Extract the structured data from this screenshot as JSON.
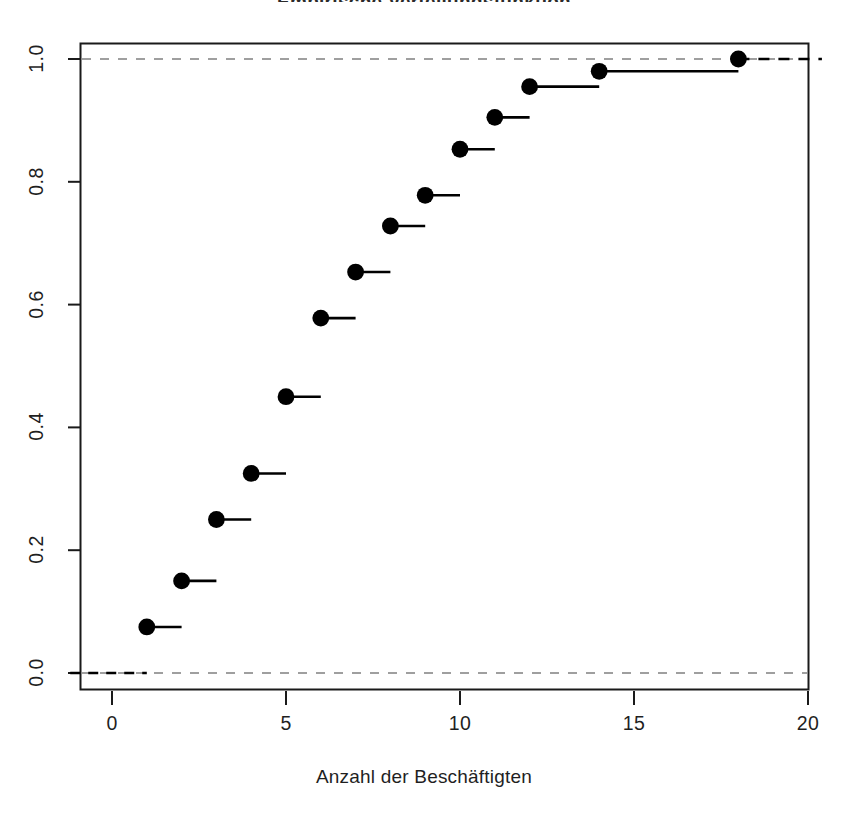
{
  "chart_data": {
    "type": "line",
    "subtype": "ecdf-step",
    "title": "Empirische Verteilungsfunktion",
    "xlabel": "Anzahl der Beschäftigten",
    "ylabel": "",
    "xlim": [
      -1.2,
      20.6
    ],
    "ylim": [
      -0.03,
      1.035
    ],
    "xticks": [
      0,
      5,
      10,
      15,
      20
    ],
    "xtick_labels": [
      "0",
      "5",
      "10",
      "15",
      "20"
    ],
    "yticks": [
      0.0,
      0.2,
      0.4,
      0.6,
      0.8,
      1.0
    ],
    "ytick_labels": [
      "0.0",
      "0.2",
      "0.4",
      "0.6",
      "0.8",
      "1.0"
    ],
    "grid": false,
    "legend": "none",
    "point_marker": "filled-circle",
    "point_color": "#000000",
    "line_color": "#000000",
    "reference_line_color": "#808080",
    "reference_line_style": "dashed",
    "reference_lines": [
      0.0,
      1.0
    ],
    "x": [
      1,
      2,
      3,
      4,
      5,
      6,
      7,
      8,
      9,
      10,
      11,
      12,
      14,
      18
    ],
    "values": [
      0.075,
      0.15,
      0.25,
      0.325,
      0.45,
      0.578,
      0.653,
      0.728,
      0.778,
      0.853,
      0.905,
      0.955,
      0.98,
      1.0
    ],
    "step_segments": [
      {
        "x_start": 1,
        "x_end": 2,
        "y": 0.075
      },
      {
        "x_start": 2,
        "x_end": 3,
        "y": 0.15
      },
      {
        "x_start": 3,
        "x_end": 4,
        "y": 0.25
      },
      {
        "x_start": 4,
        "x_end": 5,
        "y": 0.325
      },
      {
        "x_start": 5,
        "x_end": 6,
        "y": 0.45
      },
      {
        "x_start": 6,
        "x_end": 7,
        "y": 0.578
      },
      {
        "x_start": 7,
        "x_end": 8,
        "y": 0.653
      },
      {
        "x_start": 8,
        "x_end": 9,
        "y": 0.728
      },
      {
        "x_start": 9,
        "x_end": 10,
        "y": 0.778
      },
      {
        "x_start": 10,
        "x_end": 11,
        "y": 0.853
      },
      {
        "x_start": 11,
        "x_end": 12,
        "y": 0.905
      },
      {
        "x_start": 12,
        "x_end": 14,
        "y": 0.955
      },
      {
        "x_start": 14,
        "x_end": 18,
        "y": 0.98
      },
      {
        "x_start": 18,
        "x_end": 20.4,
        "y": 1.0
      }
    ],
    "baseline_segment": {
      "x_start": -1.2,
      "x_end": 1,
      "y": 0.0
    }
  },
  "axes": {
    "box_border_color": "#1a1a1a",
    "tick_color": "#1a1a1a"
  }
}
